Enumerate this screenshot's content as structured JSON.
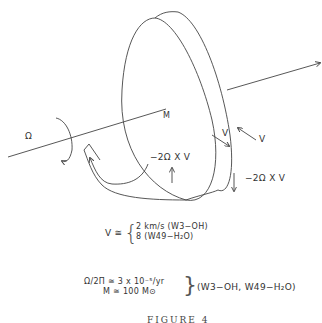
{
  "diagram": {
    "labels": {
      "omega": "Ω",
      "mass": "M",
      "v_inner": "V",
      "v_outer": "V",
      "coriolis_inner": "−2Ω X V",
      "coriolis_outer": "−2Ω X V"
    },
    "equations": {
      "v_lhs": "V ≅",
      "v_case1": "2 km/s  (W3−OH)",
      "v_case2": "8          (W49−H₂O)",
      "omega_lhs": "Ω/2Π  ≅  3 x 10⁻⁵/yr",
      "mass_lhs": "M  ≅  100 M⊙",
      "sources": "(W3−OH, W49−H₂O)"
    },
    "caption": "FIGURE 4"
  }
}
